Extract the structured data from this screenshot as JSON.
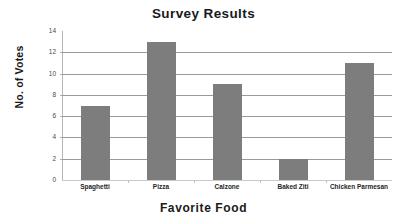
{
  "chart_data": {
    "type": "bar",
    "title": "Survey Results",
    "xlabel": "Favorite  Food",
    "ylabel": "No. of Votes",
    "categories": [
      "Spaghetti",
      "Pizza",
      "Calzone",
      "Baked Ziti",
      "Chicken Parmesan"
    ],
    "values": [
      7,
      13,
      9,
      2,
      11
    ],
    "ylim": [
      0,
      14
    ],
    "yticks": [
      0,
      2,
      4,
      6,
      8,
      10,
      12,
      14
    ],
    "ytick_labels": [
      "0",
      "2",
      "4",
      "6",
      "8",
      "10",
      "12",
      "14"
    ],
    "grid": true,
    "grid_axis": "y",
    "legend": false,
    "legend_position": "none",
    "series": [
      {
        "name": "No. of Votes",
        "values": [
          7,
          13,
          9,
          2,
          11
        ],
        "color": "#7d7d7d"
      }
    ],
    "colors": {
      "bar": "#7d7d7d",
      "gridline": "#9a9a9a",
      "axis": "#b4b4b4",
      "text": "#1a1a1a",
      "background": "#ffffff"
    }
  }
}
